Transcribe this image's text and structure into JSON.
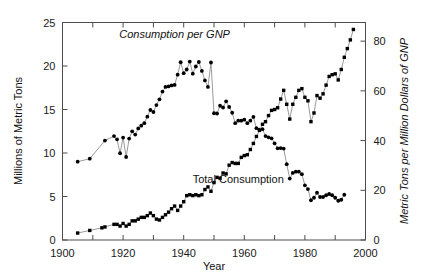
{
  "chart_data": {
    "type": "line",
    "title": "",
    "xlabel": "Year",
    "ylabel": "Millions of Metric Tons",
    "ylabel_right": "Metric Tons per Million Dollars of GNP",
    "xlim": [
      1900,
      2000
    ],
    "ylim": [
      0,
      25
    ],
    "ylim_right": [
      0,
      87.5
    ],
    "xticks": [
      1900,
      1910,
      1920,
      1930,
      1940,
      1950,
      1960,
      1970,
      1980,
      1990,
      2000
    ],
    "xtick_labels_shown": [
      "1900",
      "1920",
      "1940",
      "1960",
      "1980",
      "2000"
    ],
    "xtick_labels_shown_values": [
      1900,
      1920,
      1940,
      1960,
      1980,
      2000
    ],
    "yticks_left": [
      0,
      5,
      10,
      15,
      20,
      25
    ],
    "ytick_labels_left": [
      "0",
      "5",
      "10",
      "15",
      "20",
      "25"
    ],
    "yticks_right": [
      0,
      20,
      40,
      60,
      80
    ],
    "ytick_labels_right": [
      "0",
      "20",
      "40",
      "60",
      "80"
    ],
    "grid": false,
    "legend_position": "inline-annotations",
    "annotations": [
      {
        "text": "Consumption per GNP",
        "x": 1937,
        "y": 23.2,
        "style": "italic"
      },
      {
        "text": "Total Consumption",
        "x": 1958,
        "y": 6.6,
        "style": "normal"
      }
    ],
    "series": [
      {
        "name": "Consumption per GNP",
        "axis": "right",
        "units": "Metric Tons per Million Dollars of GNP",
        "marker": "filled-circle",
        "points": [
          [
            1905,
            31.5
          ],
          [
            1909,
            32.7
          ],
          [
            1914,
            40.0
          ],
          [
            1917,
            41.8
          ],
          [
            1918,
            40.5
          ],
          [
            1919,
            34.9
          ],
          [
            1920,
            41.2
          ],
          [
            1921,
            33.4
          ],
          [
            1922,
            40.8
          ],
          [
            1923,
            43.7
          ],
          [
            1924,
            42.4
          ],
          [
            1925,
            44.9
          ],
          [
            1926,
            46.0
          ],
          [
            1927,
            47.0
          ],
          [
            1928,
            49.6
          ],
          [
            1929,
            52.3
          ],
          [
            1930,
            51.5
          ],
          [
            1931,
            54.3
          ],
          [
            1932,
            56.6
          ],
          [
            1933,
            59.7
          ],
          [
            1934,
            61.6
          ],
          [
            1935,
            61.8
          ],
          [
            1936,
            62.2
          ],
          [
            1937,
            62.4
          ],
          [
            1938,
            66.5
          ],
          [
            1939,
            71.5
          ],
          [
            1940,
            67.1
          ],
          [
            1941,
            68.6
          ],
          [
            1942,
            71.8
          ],
          [
            1943,
            66.9
          ],
          [
            1944,
            69.8
          ],
          [
            1945,
            71.6
          ],
          [
            1946,
            68.0
          ],
          [
            1947,
            64.2
          ],
          [
            1948,
            61.6
          ],
          [
            1949,
            71.4
          ],
          [
            1950,
            51.0
          ],
          [
            1951,
            50.9
          ],
          [
            1952,
            54.0
          ],
          [
            1953,
            53.3
          ],
          [
            1954,
            55.8
          ],
          [
            1955,
            53.5
          ],
          [
            1956,
            51.2
          ],
          [
            1957,
            47.0
          ],
          [
            1958,
            48.0
          ],
          [
            1959,
            48.0
          ],
          [
            1960,
            48.4
          ],
          [
            1961,
            47.0
          ],
          [
            1962,
            48.0
          ],
          [
            1963,
            49.5
          ],
          [
            1964,
            45.0
          ],
          [
            1965,
            44.4
          ],
          [
            1966,
            44.6
          ],
          [
            1967,
            41.8
          ],
          [
            1968,
            41.3
          ],
          [
            1969,
            40.9
          ],
          [
            1970,
            38.9
          ],
          [
            1971,
            36.9
          ],
          [
            1972,
            37.0
          ],
          [
            1973,
            36.8
          ],
          [
            1974,
            30.5
          ],
          [
            1975,
            24.7
          ],
          [
            1976,
            27.0
          ],
          [
            1977,
            27.5
          ],
          [
            1978,
            27.5
          ],
          [
            1979,
            26.5
          ],
          [
            1980,
            22.0
          ],
          [
            1981,
            20.5
          ],
          [
            1982,
            16.0
          ],
          [
            1983,
            17.0
          ],
          [
            1984,
            19.0
          ],
          [
            1985,
            17.3
          ],
          [
            1986,
            17.3
          ],
          [
            1987,
            18.0
          ],
          [
            1988,
            18.5
          ],
          [
            1989,
            18.0
          ],
          [
            1990,
            17.0
          ],
          [
            1991,
            15.8
          ],
          [
            1992,
            16.2
          ],
          [
            1993,
            18.2
          ]
        ]
      },
      {
        "name": "Total Consumption",
        "axis": "left",
        "units": "Millions of Metric Tons",
        "marker": "filled-square",
        "points": [
          [
            1905,
            0.8
          ],
          [
            1909,
            1.1
          ],
          [
            1913,
            1.4
          ],
          [
            1914,
            1.5
          ],
          [
            1917,
            1.8
          ],
          [
            1918,
            1.8
          ],
          [
            1919,
            1.6
          ],
          [
            1920,
            1.9
          ],
          [
            1921,
            1.6
          ],
          [
            1922,
            1.8
          ],
          [
            1923,
            2.2
          ],
          [
            1924,
            2.2
          ],
          [
            1925,
            2.4
          ],
          [
            1926,
            2.6
          ],
          [
            1927,
            2.6
          ],
          [
            1928,
            2.8
          ],
          [
            1929,
            3.1
          ],
          [
            1930,
            2.8
          ],
          [
            1931,
            2.4
          ],
          [
            1932,
            2.3
          ],
          [
            1933,
            2.6
          ],
          [
            1934,
            2.9
          ],
          [
            1935,
            3.2
          ],
          [
            1936,
            3.6
          ],
          [
            1937,
            3.9
          ],
          [
            1938,
            3.4
          ],
          [
            1939,
            3.9
          ],
          [
            1940,
            4.4
          ],
          [
            1941,
            5.1
          ],
          [
            1942,
            5.2
          ],
          [
            1943,
            5.1
          ],
          [
            1944,
            5.2
          ],
          [
            1945,
            5.1
          ],
          [
            1946,
            5.2
          ],
          [
            1947,
            5.8
          ],
          [
            1948,
            6.1
          ],
          [
            1949,
            5.6
          ],
          [
            1950,
            6.6
          ],
          [
            1951,
            7.2
          ],
          [
            1952,
            7.1
          ],
          [
            1953,
            7.7
          ],
          [
            1954,
            7.6
          ],
          [
            1955,
            8.6
          ],
          [
            1956,
            8.9
          ],
          [
            1957,
            8.8
          ],
          [
            1958,
            8.8
          ],
          [
            1959,
            9.5
          ],
          [
            1960,
            9.7
          ],
          [
            1961,
            9.8
          ],
          [
            1962,
            10.4
          ],
          [
            1963,
            11.1
          ],
          [
            1964,
            11.9
          ],
          [
            1965,
            12.6
          ],
          [
            1966,
            13.3
          ],
          [
            1967,
            13.6
          ],
          [
            1968,
            14.3
          ],
          [
            1969,
            14.9
          ],
          [
            1970,
            15.0
          ],
          [
            1971,
            15.2
          ],
          [
            1972,
            16.2
          ],
          [
            1973,
            17.2
          ],
          [
            1974,
            15.6
          ],
          [
            1975,
            13.9
          ],
          [
            1976,
            15.6
          ],
          [
            1977,
            16.4
          ],
          [
            1978,
            17.2
          ],
          [
            1979,
            17.4
          ],
          [
            1980,
            16.4
          ],
          [
            1981,
            16.0
          ],
          [
            1982,
            13.6
          ],
          [
            1983,
            14.6
          ],
          [
            1984,
            16.6
          ],
          [
            1985,
            16.3
          ],
          [
            1986,
            16.8
          ],
          [
            1987,
            17.8
          ],
          [
            1988,
            18.8
          ],
          [
            1989,
            19.0
          ],
          [
            1990,
            19.1
          ],
          [
            1991,
            18.4
          ],
          [
            1992,
            19.6
          ],
          [
            1993,
            21.0
          ],
          [
            1994,
            22.0
          ],
          [
            1995,
            23.0
          ],
          [
            1996,
            24.2
          ]
        ]
      }
    ]
  },
  "colors": {
    "background": "#ffffff",
    "axis": "#4d4d4d",
    "marker": "#000000",
    "line": "#808080",
    "text": "#111111"
  }
}
